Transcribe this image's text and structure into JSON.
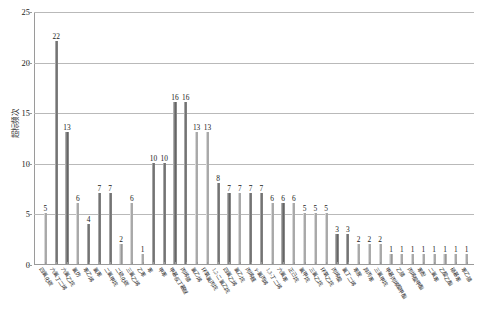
{
  "chart_data": {
    "type": "bar",
    "title": "",
    "xlabel": "",
    "ylabel": "超标频次",
    "ylim": [
      0,
      25
    ],
    "yticks": [
      0,
      5,
      10,
      15,
      20,
      25
    ],
    "grid": true,
    "legend": "none",
    "bar_color": "#8d8d8d",
    "categories": [
      "四氯化碳",
      "六氯丁二烯",
      "六氯乙烷",
      "氯仿",
      "苯乙烯",
      "氯苯",
      "二氯甲烷",
      "二硫化碳",
      "三氯乙烯",
      "乙苯",
      "苯",
      "甲苯",
      "甲基叔丁基醚",
      "丙烯腈",
      "氯乙烯",
      "环氧氯丙烷",
      "1,2-二氯乙烷",
      "四氯乙烯",
      "氯乙烷",
      "丙烯醛",
      "γ-氯丙烯",
      "1,3-丁二烯",
      "六氯苯",
      "正己烷",
      "氯甲烷",
      "三氯乙烷",
      "环氧乙烷",
      "丙烯酸",
      "氯丁二烯",
      "苯胺",
      "异丙苯",
      "三氯甲烷",
      "甲基丙烯酸甲酯",
      "乙腈",
      "丙烯酸甲酯",
      "苯酚",
      "二氯苯",
      "乙酸乙酯",
      "硝基苯",
      "苯乙腈"
    ],
    "values": [
      5,
      22,
      13,
      6,
      4,
      7,
      7,
      2,
      6,
      1,
      10,
      10,
      16,
      16,
      13,
      13,
      8,
      7,
      7,
      7,
      7,
      6,
      6,
      6,
      5,
      5,
      5,
      3,
      3,
      2,
      2,
      2,
      1,
      1,
      1,
      1,
      1,
      1,
      1,
      1
    ],
    "value_labels": [
      "5",
      "22",
      "13",
      "6",
      "4",
      "7",
      "7",
      "2",
      "6",
      "1",
      "10",
      "10",
      "16",
      "16",
      "13",
      "13",
      "8",
      "7",
      "7",
      "7",
      "7",
      "6",
      "6",
      "6",
      "5",
      "5",
      "5",
      "3",
      "3",
      "2",
      "2",
      "2",
      "1",
      "1",
      "1",
      "1",
      "1",
      "1",
      "1",
      "1"
    ]
  }
}
